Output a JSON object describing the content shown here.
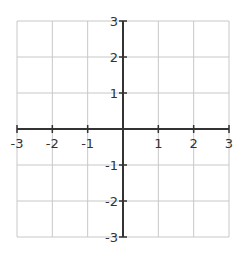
{
  "chart_data": {
    "type": "scatter",
    "title": "",
    "xlabel": "",
    "ylabel": "",
    "xlim": [
      -3,
      3
    ],
    "ylim": [
      -3,
      3
    ],
    "grid": true,
    "x_ticks": [
      -3,
      -2,
      -1,
      1,
      2,
      3
    ],
    "y_ticks": [
      -3,
      -2,
      -1,
      1,
      2,
      3
    ],
    "x_tick_labels": [
      "-3",
      "-2",
      "-1",
      "1",
      "2",
      "3"
    ],
    "y_tick_labels": [
      "-3",
      "-2",
      "-1",
      "1",
      "2",
      "3"
    ],
    "series": [],
    "legend": null,
    "colors": {
      "grid": "#c8c8c8",
      "axis": "#333333",
      "background": "#ffffff"
    }
  }
}
